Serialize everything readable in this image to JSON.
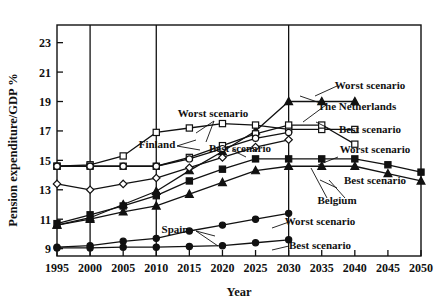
{
  "chart_data": {
    "type": "line",
    "title": "",
    "xlabel": "Year",
    "ylabel": "Pension expenditure/GDP %",
    "xlim": [
      1995,
      2050
    ],
    "ylim": [
      8.5,
      24.2
    ],
    "yticks": [
      9,
      11,
      13,
      15,
      17,
      19,
      21,
      23
    ],
    "xticks": [
      1995,
      2000,
      2005,
      2010,
      2015,
      2020,
      2025,
      2030,
      2035,
      2040,
      2045,
      2050
    ],
    "gridlines_x": [
      2000,
      2010,
      2030
    ],
    "grid": "vertical-only",
    "legend_position": "inline-annotations",
    "x": [
      1995,
      2000,
      2005,
      2010,
      2015,
      2020,
      2025,
      2030,
      2035,
      2040,
      2045,
      2050
    ],
    "series": [
      {
        "name": "The Netherlands Worst scenario",
        "country": "The Netherlands",
        "scenario": "Worst scenario",
        "marker": "filled-triangle",
        "values": [
          10.6,
          11.1,
          12.0,
          12.9,
          14.3,
          15.6,
          17.0,
          19.0,
          19.0,
          19.0,
          null,
          null
        ]
      },
      {
        "name": "Finland Worst scenario",
        "country": "Finland",
        "scenario": "Worst scenario",
        "marker": "open-square",
        "values": [
          14.6,
          14.7,
          15.3,
          16.9,
          17.2,
          17.5,
          17.4,
          17.1,
          17.1,
          17.1,
          null,
          null
        ]
      },
      {
        "name": "Finland Best scenario",
        "country": "Finland",
        "scenario": "Best scenario",
        "marker": "open-square",
        "values": [
          14.6,
          14.6,
          14.6,
          14.6,
          15.2,
          16.0,
          16.8,
          17.4,
          17.4,
          16.1,
          null,
          null
        ]
      },
      {
        "name": "Netherlands Best scenario",
        "country": "The Netherlands",
        "scenario": "Best scenario",
        "marker": "open-circle",
        "values": [
          14.6,
          14.6,
          14.6,
          14.6,
          15.1,
          15.8,
          16.5,
          16.9,
          null,
          null,
          null,
          null
        ]
      },
      {
        "name": "Secondary open-diamond series",
        "country": "",
        "scenario": "",
        "marker": "open-diamond",
        "values": [
          13.4,
          13.0,
          13.4,
          13.8,
          14.5,
          15.2,
          15.9,
          16.4,
          null,
          null,
          null,
          null
        ]
      },
      {
        "name": "Belgium Worst scenario",
        "country": "Belgium",
        "scenario": "Worst scenario",
        "marker": "filled-square",
        "values": [
          10.7,
          11.3,
          11.9,
          12.6,
          13.6,
          14.4,
          15.1,
          15.1,
          15.1,
          15.1,
          14.7,
          14.2
        ]
      },
      {
        "name": "Belgium Best scenario",
        "country": "Belgium",
        "scenario": "Best scenario",
        "marker": "filled-triangle",
        "values": [
          10.6,
          11.0,
          11.5,
          11.9,
          12.7,
          13.5,
          14.3,
          14.6,
          14.6,
          14.6,
          14.1,
          13.6
        ]
      },
      {
        "name": "Spain Worst scenario",
        "country": "Spain",
        "scenario": "Worst scenario",
        "marker": "filled-circle",
        "values": [
          9.1,
          9.2,
          9.5,
          9.7,
          10.2,
          10.6,
          11.0,
          11.4,
          null,
          null,
          null,
          null
        ]
      },
      {
        "name": "Spain Best scenario",
        "country": "Spain",
        "scenario": "Best scenario",
        "marker": "filled-circle",
        "values": [
          9.05,
          9.05,
          9.1,
          9.1,
          9.15,
          9.2,
          9.4,
          9.6,
          null,
          null,
          null,
          null
        ]
      }
    ],
    "annotations": [
      {
        "id": "ann-worst-nl",
        "text": "Worst scenario",
        "x": 370,
        "y": 89,
        "anchor": "middle"
      },
      {
        "id": "ann-netherlands",
        "text": "The Netherlands",
        "x": 357,
        "y": 110,
        "anchor": "middle"
      },
      {
        "id": "ann-worst-finland",
        "text": "Worst scenario",
        "x": 213,
        "y": 117,
        "anchor": "middle"
      },
      {
        "id": "ann-best-nl",
        "text": "Best scenario",
        "x": 370,
        "y": 133,
        "anchor": "middle"
      },
      {
        "id": "ann-finland",
        "text": "Finland",
        "x": 157,
        "y": 148,
        "anchor": "middle"
      },
      {
        "id": "ann-best-finland",
        "text": "Best scenario",
        "x": 240,
        "y": 152,
        "anchor": "middle"
      },
      {
        "id": "ann-worst-belgium",
        "text": "Worst scenario",
        "x": 375,
        "y": 153,
        "anchor": "middle"
      },
      {
        "id": "ann-best-belgium",
        "text": "Best scenario",
        "x": 375,
        "y": 184,
        "anchor": "middle"
      },
      {
        "id": "ann-belgium",
        "text": "Belgium",
        "x": 337,
        "y": 204,
        "anchor": "middle"
      },
      {
        "id": "ann-worst-spain",
        "text": "Worst scenario",
        "x": 320,
        "y": 225,
        "anchor": "middle"
      },
      {
        "id": "ann-best-spain",
        "text": "Best scenario",
        "x": 320,
        "y": 249,
        "anchor": "middle"
      },
      {
        "id": "ann-spain",
        "text": "Spain",
        "x": 175,
        "y": 233,
        "anchor": "middle"
      }
    ],
    "colors": {
      "ink": "#111111",
      "background": "#ffffff",
      "axis": "#222222"
    }
  },
  "axes": {
    "y_title": "Pension expenditure/GDP %",
    "x_title": "Year",
    "y_tick_labels": [
      "23",
      "21",
      "19",
      "17",
      "15",
      "13",
      "11",
      "9"
    ],
    "x_tick_labels": [
      "1995",
      "2000",
      "2005",
      "2010",
      "2015",
      "2020",
      "2025",
      "2030",
      "2035",
      "2040",
      "2045",
      "2050"
    ]
  }
}
